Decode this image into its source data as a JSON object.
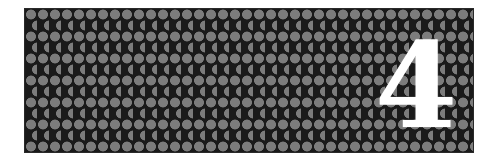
{
  "panel": {
    "pattern": "hexagonal-circle-grid",
    "colors": {
      "background": "#1a1a1a",
      "circle": "#7c7c7c",
      "numeral": "#ffffff"
    },
    "numeral": "4"
  }
}
